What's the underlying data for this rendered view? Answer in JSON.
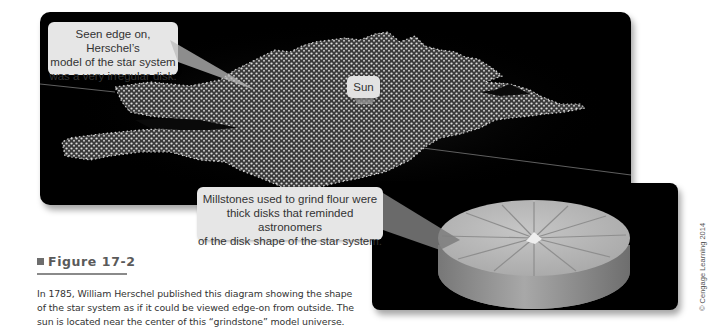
{
  "figure": {
    "label": "Figure 17-2",
    "caption_lines": [
      "In 1785, William Herschel published this diagram showing the shape",
      "of the star system as if it could be viewed edge-on from outside. The",
      "sun is located near the center of this “grindstone” model universe."
    ]
  },
  "top_panel": {
    "callout_lines": [
      "Seen edge on, Herschel’s",
      "model of the star system",
      "was a very irregular disk."
    ],
    "sun_label": "Sun"
  },
  "bottom_panel": {
    "callout_lines": [
      "Millstones used to grind flour were",
      "thick disks that reminded astronomers",
      "of the disk shape of the star system."
    ]
  },
  "credit": "© Cengage Learning 2014",
  "colors": {
    "panel_bg": "#000000",
    "callout_bg": "#e6e6e6",
    "star_dots": "#d8d8d8",
    "millstone_top": "#b9b9b9",
    "millstone_side": "#8c8c8c",
    "caption_title": "#5a5a5a"
  }
}
